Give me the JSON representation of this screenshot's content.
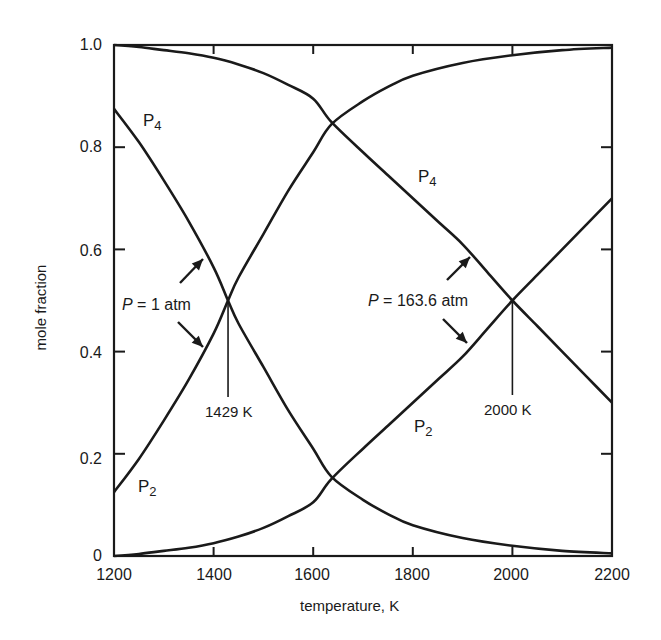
{
  "chart_data": {
    "type": "line",
    "title": "",
    "xlabel": "temperature, K",
    "ylabel": "mole fraction",
    "xlim": [
      1200,
      2200
    ],
    "ylim": [
      0,
      1.0
    ],
    "grid": false,
    "x_ticks": [
      "1200",
      "1400",
      "1600",
      "1800",
      "2000",
      "2200"
    ],
    "y_ticks": [
      "0",
      "0.2",
      "0.4",
      "0.6",
      "0.8",
      "1.0"
    ],
    "legend": "none (curves labeled inline)",
    "series": [
      {
        "name": "P4 (P = 1 atm)",
        "x": [
          1200,
          1250,
          1300,
          1350,
          1400,
          1429,
          1450,
          1500,
          1550,
          1600,
          1637,
          1700,
          1750,
          1800,
          1900,
          2000,
          2100,
          2200
        ],
        "values": [
          0.875,
          0.81,
          0.735,
          0.655,
          0.565,
          0.5,
          0.455,
          0.37,
          0.285,
          0.21,
          0.155,
          0.11,
          0.082,
          0.06,
          0.035,
          0.02,
          0.01,
          0.005
        ]
      },
      {
        "name": "P2 (P = 1 atm)",
        "x": [
          1200,
          1250,
          1300,
          1350,
          1400,
          1429,
          1450,
          1500,
          1550,
          1600,
          1637,
          1700,
          1750,
          1800,
          1900,
          2000,
          2100,
          2200
        ],
        "values": [
          0.125,
          0.19,
          0.265,
          0.345,
          0.435,
          0.5,
          0.545,
          0.63,
          0.715,
          0.79,
          0.845,
          0.89,
          0.918,
          0.94,
          0.965,
          0.98,
          0.99,
          0.995
        ]
      },
      {
        "name": "P4 (P = 163.6 atm)",
        "x": [
          1200,
          1250,
          1300,
          1350,
          1400,
          1450,
          1500,
          1550,
          1600,
          1636,
          1700,
          1750,
          1800,
          1850,
          1900,
          1950,
          2000,
          2050,
          2100,
          2150,
          2200
        ],
        "values": [
          1.0,
          0.996,
          0.99,
          0.984,
          0.975,
          0.962,
          0.945,
          0.922,
          0.895,
          0.85,
          0.79,
          0.745,
          0.7,
          0.655,
          0.61,
          0.555,
          0.5,
          0.45,
          0.4,
          0.35,
          0.3
        ]
      },
      {
        "name": "P2 (P = 163.6 atm)",
        "x": [
          1200,
          1250,
          1300,
          1350,
          1400,
          1450,
          1500,
          1550,
          1600,
          1636,
          1700,
          1750,
          1800,
          1850,
          1900,
          1950,
          2000,
          2050,
          2100,
          2150,
          2200
        ],
        "values": [
          0.0,
          0.004,
          0.01,
          0.016,
          0.025,
          0.038,
          0.055,
          0.078,
          0.105,
          0.15,
          0.21,
          0.255,
          0.3,
          0.345,
          0.39,
          0.445,
          0.5,
          0.55,
          0.6,
          0.65,
          0.7
        ]
      }
    ],
    "annotations": [
      {
        "text": "P = 1 atm",
        "points_to": "crossing at T = 1429 K, mole fraction 0.5",
        "arrows": 2
      },
      {
        "text": "1429 K",
        "x": 1429,
        "drop_line": true
      },
      {
        "text": "P = 163.6 atm",
        "points_to": "crossing at T = 2000 K, mole fraction 0.5",
        "arrows": 2
      },
      {
        "text": "2000 K",
        "x": 2000,
        "drop_line": true
      },
      {
        "text": "P4",
        "near": "P = 1 atm P4 curve, upper left"
      },
      {
        "text": "P2",
        "near": "P = 1 atm P2 curve, lower left"
      },
      {
        "text": "P4",
        "near": "P = 163.6 atm P4 curve, upper right"
      },
      {
        "text": "P2",
        "near": "P = 163.6 atm P2 curve, lower right"
      }
    ]
  },
  "axes": {
    "xlabel": "temperature, K",
    "ylabel": "mole fraction",
    "x_ticks": [
      "1200",
      "1400",
      "1600",
      "1800",
      "2000",
      "2200"
    ],
    "y_ticks": [
      "0",
      "0.2",
      "0.4",
      "0.6",
      "0.8",
      "1.0"
    ]
  },
  "labels": {
    "species_p": "P",
    "sub_4": "4",
    "sub_2": "2",
    "p_italic": "P",
    "p1_rest": " = 1 atm",
    "p163_rest": " = 163.6 atm",
    "t1": "1429 K",
    "t2": "2000 K"
  },
  "style": {
    "line_color": "#1a1a1a"
  }
}
